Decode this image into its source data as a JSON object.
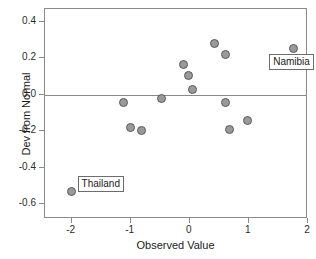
{
  "chart_data": {
    "type": "scatter",
    "title": "",
    "xlabel": "Observed Value",
    "ylabel": "Dev from Normal",
    "xlim": [
      -2.45,
      2.0
    ],
    "ylim": [
      -0.68,
      0.47
    ],
    "xticks": [
      "-2",
      "-1",
      "0",
      "1",
      "2"
    ],
    "xtick_values": [
      -2,
      -1,
      0,
      1,
      2
    ],
    "yticks": [
      "0.4",
      "0.2",
      "0.0",
      "-0.2",
      "-0.4",
      "-0.6"
    ],
    "ytick_values": [
      0.4,
      0.2,
      0.0,
      -0.2,
      -0.4,
      -0.6
    ],
    "grid": false,
    "legend": "none",
    "reference_line": {
      "axis": "y",
      "value": 0.0
    },
    "marker_fill": "#9a9a9a",
    "marker_edge": "#5a5a5a",
    "frame_color": "#8a8a8a",
    "points": [
      {
        "x": -2.0,
        "y": -0.53,
        "label": "Thailand"
      },
      {
        "x": -1.12,
        "y": -0.04,
        "label": ""
      },
      {
        "x": -1.0,
        "y": -0.18,
        "label": ""
      },
      {
        "x": -0.82,
        "y": -0.195,
        "label": ""
      },
      {
        "x": -0.48,
        "y": -0.02,
        "label": ""
      },
      {
        "x": -0.1,
        "y": 0.165,
        "label": ""
      },
      {
        "x": -0.02,
        "y": 0.105,
        "label": ""
      },
      {
        "x": 0.05,
        "y": 0.03,
        "label": ""
      },
      {
        "x": 0.42,
        "y": 0.28,
        "label": ""
      },
      {
        "x": 0.6,
        "y": 0.222,
        "label": ""
      },
      {
        "x": 0.6,
        "y": -0.04,
        "label": ""
      },
      {
        "x": 0.67,
        "y": -0.188,
        "label": ""
      },
      {
        "x": 0.97,
        "y": -0.14,
        "label": ""
      },
      {
        "x": 1.75,
        "y": 0.255,
        "label": "Namibia"
      }
    ],
    "annotations": [
      {
        "text": "Thailand",
        "point_x": -2.0,
        "point_y": -0.53
      },
      {
        "text": "Namibia",
        "point_x": 1.75,
        "point_y": 0.255
      }
    ]
  }
}
